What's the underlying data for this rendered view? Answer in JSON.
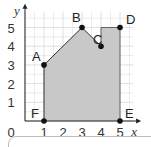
{
  "chart_data": {
    "type": "area",
    "title": "",
    "xlabel": "x",
    "ylabel": "y",
    "xlim": [
      0,
      5
    ],
    "ylim": [
      0,
      5
    ],
    "grid": true,
    "x_ticks": [
      "1",
      "2",
      "3",
      "4",
      "5"
    ],
    "y_ticks": [
      "1",
      "2",
      "3",
      "4",
      "5"
    ],
    "origin_label": "0",
    "points": [
      {
        "label": "A",
        "x": 1,
        "y": 3
      },
      {
        "label": "B",
        "x": 3,
        "y": 5
      },
      {
        "label": "C",
        "x": 4,
        "y": 4
      },
      {
        "label": "D",
        "x": 5,
        "y": 5
      },
      {
        "label": "E",
        "x": 5,
        "y": 0
      },
      {
        "label": "F",
        "x": 1,
        "y": 0
      }
    ],
    "shaded_region": "polygon A-B-C-(4,5)-D-E-F",
    "fill_color": "#c8c8c8"
  }
}
